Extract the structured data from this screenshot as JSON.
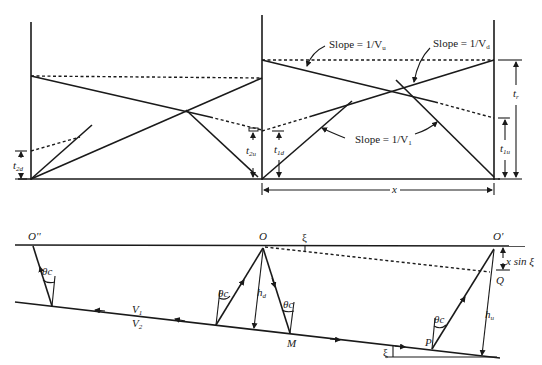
{
  "figure": {
    "type": "seismic-refraction-dipping-layer-diagram",
    "top_panel": {
      "title": "Reversed refraction travel-time curves",
      "labels": {
        "slope_u": "Slope = 1/V",
        "slope_u_sub": "u",
        "slope_d": "Slope = 1/V",
        "slope_d_sub": "d",
        "slope_1": "Slope = 1/V",
        "slope_1_sub": "1",
        "t_r": "t",
        "t_r_sub": "r",
        "t_1u": "t",
        "t_1u_sub": "1u",
        "t_1d": "t",
        "t_1d_sub": "1d",
        "t_2u": "t",
        "t_2u_sub": "2u",
        "t_2d": "t",
        "t_2d_sub": "2d",
        "x": "x"
      }
    },
    "bottom_panel": {
      "title": "Ray geometry over dipping interface",
      "labels": {
        "O_double_prime": "O''",
        "O": "O",
        "O_prime": "O'",
        "Q": "Q",
        "M": "M",
        "P": "P",
        "xi_top": "ξ",
        "xi_bottom": "ξ",
        "x_sin_xi": "x sin ξ",
        "h_d": "h",
        "h_d_sub": "d",
        "h_u": "h",
        "h_u_sub": "u",
        "theta_c": "θc",
        "V1": "V",
        "V1_sub": "1",
        "V2": "V",
        "V2_sub": "2"
      }
    }
  }
}
